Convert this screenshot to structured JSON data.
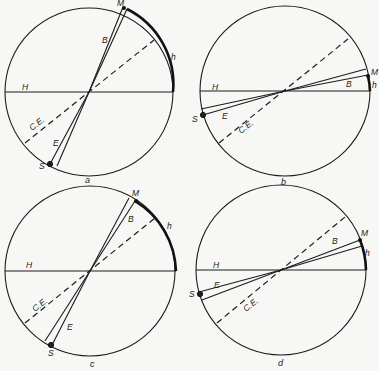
{
  "figure": {
    "panels": [
      {
        "id": "a",
        "caption": "a",
        "labels": {
          "moon": "M",
          "sun": "S",
          "horizon": "H",
          "ecliptic_arc": "h",
          "beta": "B",
          "epsilon": "E",
          "celestial_equator": "C.E."
        }
      },
      {
        "id": "b",
        "caption": "b",
        "labels": {
          "moon": "M",
          "sun": "S",
          "horizon": "H",
          "ecliptic_arc": "h",
          "beta": "B",
          "epsilon": "E",
          "celestial_equator": "C.E."
        }
      },
      {
        "id": "c",
        "caption": "c",
        "labels": {
          "moon": "M",
          "sun": "S",
          "horizon": "H",
          "ecliptic_arc": "h",
          "beta": "B",
          "epsilon": "E",
          "celestial_equator": "C.E."
        }
      },
      {
        "id": "d",
        "caption": "d",
        "labels": {
          "moon": "M",
          "sun": "S",
          "horizon": "H",
          "ecliptic_arc": "h",
          "beta": "B",
          "epsilon": "E",
          "celestial_equator": "C.E."
        }
      }
    ]
  }
}
